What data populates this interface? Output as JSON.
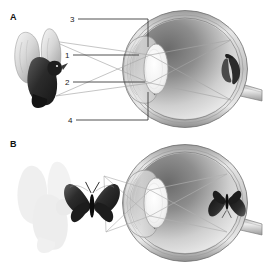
{
  "figure": {
    "background_color": "#ffffff",
    "width": 263,
    "height": 268,
    "type": "anatomical-diagram"
  },
  "panels": [
    {
      "id": "A",
      "label": "A",
      "object_viewed": "pigeon",
      "retinal_image": "inverted pigeon",
      "has_callouts": true
    },
    {
      "id": "B",
      "label": "B",
      "object_viewed": "butterfly",
      "faded_object": "pigeon",
      "retinal_image": "inverted butterfly",
      "has_callouts": false
    }
  ],
  "callouts": [
    {
      "number": "3",
      "target": "cornea"
    },
    {
      "number": "1",
      "target": "pupil"
    },
    {
      "number": "2",
      "target": "lens"
    },
    {
      "number": "4",
      "target": "sclera"
    }
  ],
  "colors": {
    "ink": "#1a1a1a",
    "leader_line": "#3a3a3a",
    "ray_line": "#9a9a9a",
    "sclera_outer": "#d9d9d9",
    "sclera_mid": "#b4b4b4",
    "sclera_dark": "#7d7d7d",
    "vitreous_light": "#f2f2f2",
    "vitreous_dark": "#4a4a4a",
    "lens_fill": "#f4f4f4",
    "cornea_fill": "#e8e8e8",
    "bird_dark": "#2e2e2e",
    "bird_mid": "#8a8a8a",
    "bird_light": "#d0d0d0",
    "ghost_bird": "#e3e3e3",
    "butterfly_dark": "#2a2a2a",
    "butterfly_mid": "#6e6e6e"
  }
}
